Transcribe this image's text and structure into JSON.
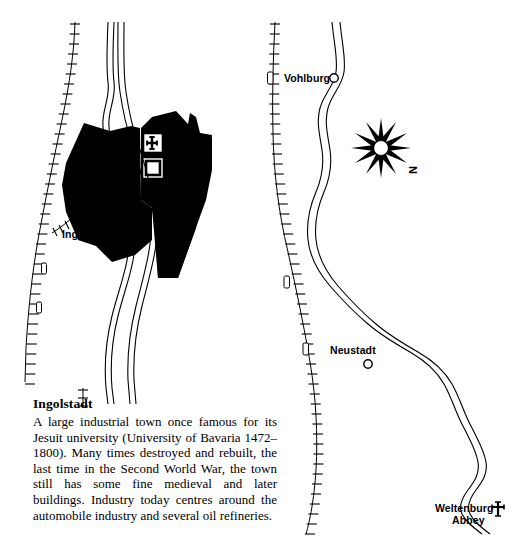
{
  "page": {
    "width": 527,
    "height": 542,
    "background": "#ffffff",
    "ink": "#000000"
  },
  "caption": {
    "title": "Ingolstadt",
    "body": "A large industrial town once famous for its Jesuit university (University of Bavaria 1472–1800). Many times destroyed and rebuilt, the last time in the Second World War, the town still has some fine medieval and later buildings. Industry today centres around the automobile industry and several oil refineries."
  },
  "maps": {
    "left": {
      "name": "ingolstadt-town-plan",
      "city_label": "Ingoldstadt",
      "symbols": [
        {
          "name": "church-symbol",
          "label": "church"
        },
        {
          "name": "building-symbol",
          "label": "building"
        }
      ],
      "features": [
        {
          "name": "built-up-area",
          "label": "urban area"
        },
        {
          "name": "river-danube",
          "label": "river"
        },
        {
          "name": "railway-line",
          "label": "railway"
        }
      ]
    },
    "right": {
      "name": "danube-valley-map",
      "places": [
        {
          "name": "vohlburg",
          "label": "Vohlburg",
          "marker": "circle-marker"
        },
        {
          "name": "neustadt",
          "label": "Neustadt",
          "marker": "circle-marker"
        },
        {
          "name": "weltenburg-abbey",
          "label_line1": "Weltenburg",
          "label_line2": "Abbey",
          "marker": "abbey-cross-symbol"
        }
      ],
      "compass": {
        "name": "compass-rose",
        "north_label": "N"
      },
      "features": [
        {
          "name": "river-danube",
          "label": "river"
        },
        {
          "name": "railway-line",
          "label": "railway"
        }
      ]
    }
  }
}
